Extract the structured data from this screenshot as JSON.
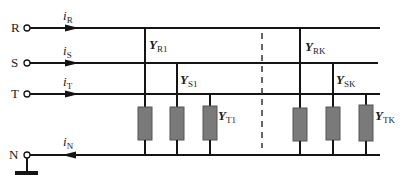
{
  "figure": {
    "terminals": [
      {
        "label": "R"
      },
      {
        "label": "S"
      },
      {
        "label": "T"
      },
      {
        "label": "N"
      }
    ],
    "currents": [
      {
        "symbol": "i",
        "sub": "R"
      },
      {
        "symbol": "i",
        "sub": "S"
      },
      {
        "symbol": "i",
        "sub": "T"
      },
      {
        "symbol": "i",
        "sub": "N"
      }
    ],
    "admittances": [
      {
        "symbol": "Y",
        "sub": "R1"
      },
      {
        "symbol": "Y",
        "sub": "S1"
      },
      {
        "symbol": "Y",
        "sub": "T1"
      },
      {
        "symbol": "Y",
        "sub": "RK"
      },
      {
        "symbol": "Y",
        "sub": "SK"
      },
      {
        "symbol": "Y",
        "sub": "TK"
      }
    ],
    "colors": {
      "wire": "#141414",
      "admittance_fill": "#7a7a7a",
      "admittance_border": "#555555"
    }
  }
}
